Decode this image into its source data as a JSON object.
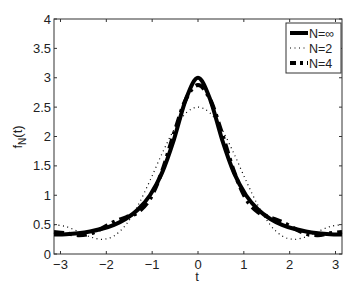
{
  "chart_data": {
    "type": "line",
    "title": "",
    "xlabel": "t",
    "ylabel": "f_N(t)",
    "xlim": [
      -3.1416,
      3.1416
    ],
    "ylim": [
      0,
      4
    ],
    "xticks": [
      -3,
      -2,
      -1,
      0,
      1,
      2,
      3
    ],
    "xtick_labels": [
      "−3",
      "−2",
      "−1",
      "0",
      "1",
      "2",
      "3"
    ],
    "yticks": [
      0,
      0.5,
      1,
      1.5,
      2,
      2.5,
      3,
      3.5,
      4
    ],
    "ytick_labels": [
      "0",
      "0.5",
      "1",
      "1.5",
      "2",
      "2.5",
      "3",
      "3.5",
      "4"
    ],
    "grid": false,
    "legend_position": "upper right",
    "x": [
      -3.1416,
      -2.8798,
      -2.618,
      -2.3562,
      -2.0944,
      -1.8326,
      -1.5708,
      -1.309,
      -1.0472,
      -0.7854,
      -0.5236,
      -0.2618,
      0,
      0.2618,
      0.5236,
      0.7854,
      1.0472,
      1.309,
      1.5708,
      1.8326,
      2.0944,
      2.3562,
      2.618,
      2.8798,
      3.1416
    ],
    "series": [
      {
        "name": "N=∞",
        "style": "solid-thick",
        "values": [
          0.333,
          0.338,
          0.354,
          0.383,
          0.429,
          0.497,
          0.6,
          0.757,
          1.0,
          1.381,
          1.953,
          2.64,
          3.0,
          2.64,
          1.953,
          1.381,
          1.0,
          0.757,
          0.6,
          0.497,
          0.429,
          0.383,
          0.354,
          0.338,
          0.333
        ]
      },
      {
        "name": "N=2",
        "style": "dotted",
        "values": [
          0.5,
          0.467,
          0.384,
          0.293,
          0.25,
          0.308,
          0.5,
          0.826,
          1.25,
          1.707,
          2.116,
          2.399,
          2.5,
          2.399,
          2.116,
          1.707,
          1.25,
          0.826,
          0.5,
          0.308,
          0.25,
          0.293,
          0.384,
          0.467,
          0.5
        ]
      },
      {
        "name": "N=4",
        "style": "dash-dot-thick",
        "values": [
          0.375,
          0.353,
          0.321,
          0.345,
          0.4375,
          0.547,
          0.625,
          0.712,
          0.9375,
          1.405,
          2.054,
          2.638,
          2.875,
          2.638,
          2.054,
          1.405,
          0.9375,
          0.712,
          0.625,
          0.547,
          0.4375,
          0.345,
          0.321,
          0.353,
          0.375
        ]
      }
    ]
  },
  "colors": {
    "line": "#000000",
    "axis": "#333333",
    "background": "#ffffff"
  }
}
